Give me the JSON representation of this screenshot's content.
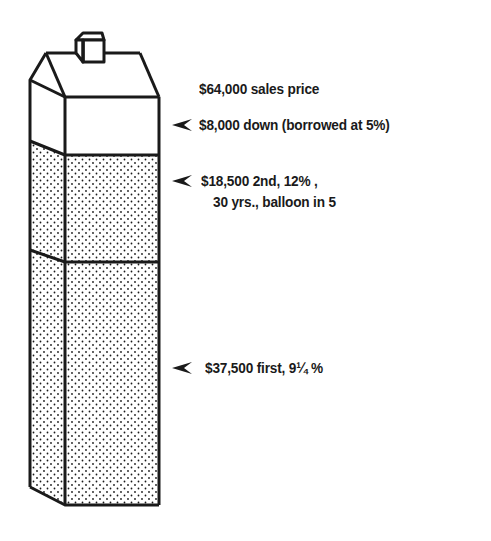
{
  "diagram": {
    "sections": [
      {
        "id": "down",
        "label": "$8,000 down (borrowed at 5%)",
        "fill": "white"
      },
      {
        "id": "second",
        "label_line1": "$18,500 2nd, 12% ,",
        "label_line2": "30 yrs., balloon in 5",
        "fill": "dotted"
      },
      {
        "id": "first",
        "label": "$37,500 first, 9¼ %",
        "fill": "dotted"
      }
    ],
    "title_label": "$64,000 sales price",
    "colors": {
      "ink": "#1a1a1a",
      "background": "#ffffff"
    },
    "icons": {
      "pointer": "arrowhead-left-icon"
    }
  }
}
